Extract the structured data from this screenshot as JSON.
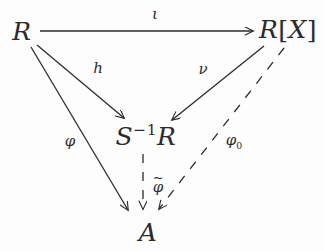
{
  "figure": {
    "kind": "commutative-diagram",
    "ink_color": "#2b2b2b",
    "background_color": "#fdfdfd"
  },
  "nodes": {
    "top_left": "R",
    "top_right_base": "R",
    "top_right_bracket_open": "[",
    "top_right_variable": "X",
    "top_right_bracket_close": "]",
    "center_base": "S",
    "center_exponent": "−1",
    "center_ring": "R",
    "bottom": "A"
  },
  "edges": {
    "iota_label": "ι",
    "h_label": "h",
    "nu_label": "ν",
    "phi_label": "φ",
    "phi_zero_base": "φ",
    "phi_zero_sub": "0",
    "phi_tilde_base": "φ",
    "phi_tilde_mark": "~"
  }
}
